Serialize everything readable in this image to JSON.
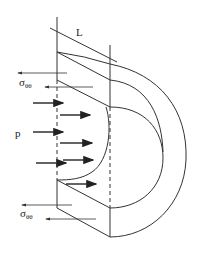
{
  "diagram": {
    "labels": {
      "length": "L",
      "pressure": "p",
      "stress_top_main": "σ",
      "stress_top_sub": "θθ",
      "stress_bottom_main": "σ",
      "stress_bottom_sub": "θθ"
    },
    "colors": {
      "line": "#333333",
      "arrow": "#222222",
      "background": "#ffffff"
    }
  }
}
